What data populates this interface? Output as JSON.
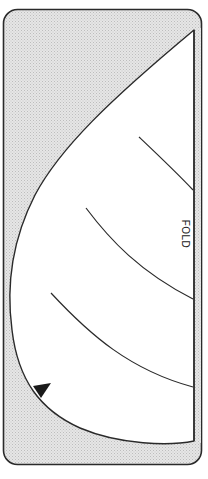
{
  "diagram": {
    "type": "fold-pattern",
    "fold_label": "FOLD",
    "colors": {
      "background": "#ffffff",
      "shaded_area": "#d9d9d9",
      "outline": "#2a2a2a",
      "pattern_piece": "#ffffff",
      "marker": "#1a1a1a"
    },
    "elements": {
      "outer_frame": "rounded rectangle with shaded fill",
      "pattern_piece": "white curved piece bounded by fold line on right",
      "guide_lines": 3,
      "notch_marker": "black triangle on left curved edge"
    }
  }
}
